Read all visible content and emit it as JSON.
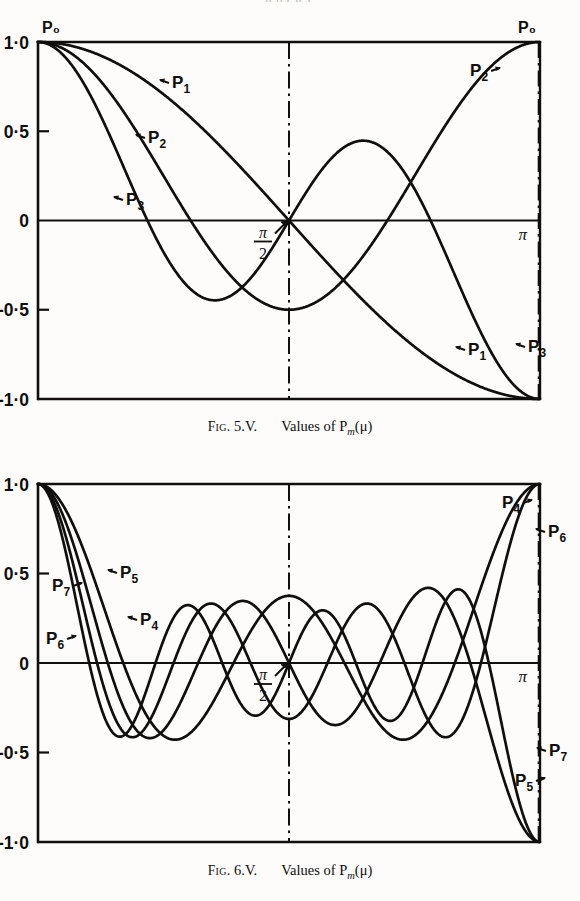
{
  "page": {
    "top_cropped_text": "g  p  ( g      ),",
    "background": "#fdfcfa",
    "ink": "#100f0d"
  },
  "axis": {
    "y_ticks": [
      "1·0",
      "0·5",
      "0",
      "-0·5",
      "-1·0"
    ],
    "y_values": [
      1.0,
      0.5,
      0,
      -0.5,
      -1.0
    ],
    "x_labels": {
      "origin": "P₀",
      "mid": "π/2",
      "end": "π",
      "end_top": "P₀"
    },
    "pi_half_numerator": "π",
    "pi_half_denominator": "2",
    "pi_symbol": "π"
  },
  "figure1": {
    "caption_fig": "Fig.",
    "caption_number": "5.V.",
    "caption_text": "Values of P",
    "caption_sub": "m",
    "caption_arg": "(μ)",
    "top_left_label": "P₀",
    "top_right_label": "P₀",
    "labels": [
      {
        "name": "P₁",
        "text": "P",
        "sub": "1",
        "x": 172,
        "y": 88,
        "arrow": "left"
      },
      {
        "name": "P₂",
        "text": "P",
        "sub": "2",
        "x": 148,
        "y": 143,
        "arrow": "left"
      },
      {
        "name": "P₃",
        "text": "P",
        "sub": "3",
        "x": 126,
        "y": 205,
        "arrow": "left"
      },
      {
        "name": "P₂",
        "text": "P",
        "sub": "2",
        "x": 470,
        "y": 76,
        "arrow": "right"
      },
      {
        "name": "P₁",
        "text": "P",
        "sub": "1",
        "x": 468,
        "y": 355,
        "arrow": "left"
      },
      {
        "name": "P₃",
        "text": "P",
        "sub": "3",
        "x": 528,
        "y": 352,
        "arrow": "left"
      }
    ]
  },
  "figure2": {
    "caption_fig": "Fig.",
    "caption_number": "6.V.",
    "caption_text": "Values of P",
    "caption_sub": "m",
    "caption_arg": "(μ)",
    "labels": [
      {
        "name": "P₇",
        "text": "P",
        "sub": "7",
        "x": 52,
        "y": 605,
        "arrow": "right"
      },
      {
        "name": "P₅",
        "text": "P",
        "sub": "5",
        "x": 120,
        "y": 592,
        "arrow": "left"
      },
      {
        "name": "P₆",
        "text": "P",
        "sub": "6",
        "x": 46,
        "y": 658,
        "arrow": "right"
      },
      {
        "name": "P₄",
        "text": "P",
        "sub": "4",
        "x": 140,
        "y": 639,
        "arrow": "left"
      },
      {
        "name": "P₄",
        "text": "P",
        "sub": "4",
        "x": 502,
        "y": 522,
        "arrow": "right"
      },
      {
        "name": "P₆",
        "text": "P",
        "sub": "6",
        "x": 548,
        "y": 551,
        "arrow": "left"
      },
      {
        "name": "P₇",
        "text": "P",
        "sub": "7",
        "x": 549,
        "y": 770,
        "arrow": "left"
      },
      {
        "name": "P₅",
        "text": "P",
        "sub": "5",
        "x": 515,
        "y": 800,
        "arrow": "right"
      }
    ]
  },
  "chart_data": [
    {
      "type": "line",
      "title": "Fig. 5.V. Values of P_m(μ)",
      "xlabel": "θ",
      "ylabel": "P_m(cos θ)",
      "xlim": [
        0,
        3.141592653589793
      ],
      "ylim": [
        -1.0,
        1.0
      ],
      "x_tick_labels": [
        "P₀",
        "π/2",
        "π"
      ],
      "x_tick_values": [
        0,
        1.5707963,
        3.1415927
      ],
      "y_tick_labels": [
        "1·0",
        "0·5",
        "0",
        "-0·5",
        "-1·0"
      ],
      "y_tick_values": [
        1.0,
        0.5,
        0,
        -0.5,
        -1.0
      ],
      "grid": false,
      "legend": "inline-labels",
      "series": [
        {
          "name": "P₀",
          "degree": 0,
          "endpoints": [
            1.0,
            1.0
          ],
          "zeros": [],
          "extrema": []
        },
        {
          "name": "P₁",
          "degree": 1,
          "endpoints": [
            1.0,
            -1.0
          ],
          "zeros": [
            1.5707963
          ],
          "extrema": []
        },
        {
          "name": "P₂",
          "degree": 2,
          "endpoints": [
            1.0,
            1.0
          ],
          "zeros": [
            0.9553166,
            2.186276
          ],
          "extrema": [
            {
              "x": 1.5707963,
              "y": -0.5
            }
          ]
        },
        {
          "name": "P₃",
          "degree": 3,
          "endpoints": [
            1.0,
            -1.0
          ],
          "zeros": [
            0.6847192,
            1.5707963,
            2.4568734
          ],
          "extrema": [
            {
              "x": 1.1503,
              "y": -0.3849
            },
            {
              "x": 1.9913,
              "y": 0.3849
            }
          ]
        }
      ]
    },
    {
      "type": "line",
      "title": "Fig. 6.V. Values of P_m(μ)",
      "xlabel": "θ",
      "ylabel": "P_m(cos θ)",
      "xlim": [
        0,
        3.141592653589793
      ],
      "ylim": [
        -1.0,
        1.0
      ],
      "x_tick_labels": [
        "",
        "π/2",
        "π"
      ],
      "x_tick_values": [
        0,
        1.5707963,
        3.1415927
      ],
      "y_tick_labels": [
        "1·0",
        "0·5",
        "0",
        "-0·5",
        "-1·0"
      ],
      "y_tick_values": [
        1.0,
        0.5,
        0,
        -0.5,
        -1.0
      ],
      "grid": false,
      "legend": "inline-labels",
      "series": [
        {
          "name": "P₄",
          "degree": 4,
          "endpoints": [
            1.0,
            1.0
          ],
          "peak_amplitude": 0.42
        },
        {
          "name": "P₅",
          "degree": 5,
          "endpoints": [
            1.0,
            -1.0
          ],
          "peak_amplitude": 0.4
        },
        {
          "name": "P₆",
          "degree": 6,
          "endpoints": [
            1.0,
            1.0
          ],
          "peak_amplitude": 0.39
        },
        {
          "name": "P₇",
          "degree": 7,
          "endpoints": [
            1.0,
            -1.0
          ],
          "peak_amplitude": 0.38
        }
      ]
    }
  ]
}
